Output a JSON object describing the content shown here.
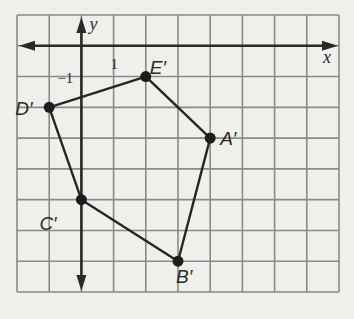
{
  "diagram": {
    "type": "coordinate-plane",
    "grid": {
      "columns": 10,
      "rows": 9,
      "x_min": -2,
      "x_max": 8,
      "y_min": -8,
      "y_max": 1,
      "background": "#efefec",
      "line_color": "#8a8a88"
    },
    "axes": {
      "x_label": "x",
      "y_label": "y",
      "x_tick_label": "1",
      "y_tick_label": "−1",
      "color": "#2a2a2a"
    },
    "polygon": {
      "name": "A'B'C'D'E'",
      "color": "#262626",
      "vertices": [
        {
          "label": "A′",
          "x": 4,
          "y": -3
        },
        {
          "label": "B′",
          "x": 3,
          "y": -7
        },
        {
          "label": "C′",
          "x": 0,
          "y": -5
        },
        {
          "label": "D′",
          "x": -1,
          "y": -2
        },
        {
          "label": "E′",
          "x": 2,
          "y": -1
        }
      ]
    }
  }
}
